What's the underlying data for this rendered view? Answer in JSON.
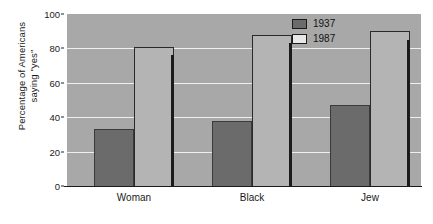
{
  "chart_data": {
    "type": "bar",
    "title": "",
    "xlabel": "",
    "ylabel": "Percentage of Americans saying \"yes\"",
    "ylabel_line1": "Percentage of Americans",
    "ylabel_line2": "saying \"yes\"",
    "ylim": [
      0,
      100
    ],
    "ytick_labels": [
      "0",
      "20",
      "40",
      "60",
      "80",
      "100"
    ],
    "ytick_values": [
      0,
      20,
      40,
      60,
      80,
      100
    ],
    "grid": true,
    "grid_axis": "y",
    "legend_position": "top-right",
    "categories": [
      "Woman",
      "Black",
      "Jew"
    ],
    "series": [
      {
        "name": "1937",
        "color": "#6b6b6b",
        "values": [
          33,
          38,
          47
        ]
      },
      {
        "name": "1987",
        "color": "#b4b4b4",
        "values": [
          81,
          88,
          90
        ]
      }
    ],
    "separators": [
      {
        "after_category": "Woman",
        "height": 76
      },
      {
        "after_category": "Black",
        "height": 83
      },
      {
        "after_category": "Jew",
        "height": 85
      }
    ],
    "plot_background": "#a8a8a8",
    "gridline_color": "#efefef"
  },
  "legend": {
    "entries": [
      {
        "label": "1937",
        "swatch": "dark-gray-swatch"
      },
      {
        "label": "1987",
        "swatch": "white-swatch"
      }
    ]
  }
}
